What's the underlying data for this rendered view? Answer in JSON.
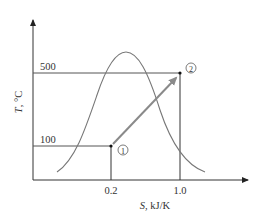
{
  "diagram": {
    "type": "T-S diagram",
    "y_axis": {
      "label_symbol": "T",
      "label_unit": ", °C",
      "ticks": [
        "500",
        "100"
      ]
    },
    "x_axis": {
      "label_symbol": "S",
      "label_unit": ", kJ/K",
      "ticks": [
        "0.2",
        "1.0"
      ]
    },
    "points": [
      {
        "id": "1",
        "marker": "①",
        "T": 100,
        "S": 0.2
      },
      {
        "id": "2",
        "marker": "②",
        "T": 500,
        "S": 1.0
      }
    ],
    "process": "arrow from state 1 to state 2",
    "curve": "saturation dome (bell-shaped curve)",
    "colors": {
      "axis": "#333333",
      "curve": "#777777",
      "arrow": "#8a8a8a",
      "grid_lines": "#555555"
    }
  }
}
